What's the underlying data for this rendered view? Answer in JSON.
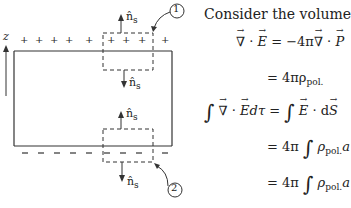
{
  "figure": {
    "axis_label": "z",
    "normal_label": "n̂",
    "normal_sub": "s",
    "top_charges": "+",
    "bottom_charges": "−",
    "callout_1": "1",
    "callout_2": "2",
    "line_color": "#333333"
  },
  "text": {
    "intro": "Consider the volume",
    "eq1_rhs": "= −4π",
    "eq2": "= 4πρ",
    "eq2_sub": "pol.",
    "eq3_lhs_end": "dτ =",
    "eq3_rhs_end": "· d",
    "eq4": "= 4π",
    "eq4_rho": "ρ",
    "eq4_sub": "pol.",
    "eq4_tail": "a",
    "eq5": "= 4π",
    "eq5_rho": "ρ",
    "eq5_sub": "pol.",
    "eq5_tail": "a",
    "nabla": "∇",
    "dot": "·",
    "E": "E",
    "P": "P",
    "S": "S",
    "integral": "∫"
  }
}
